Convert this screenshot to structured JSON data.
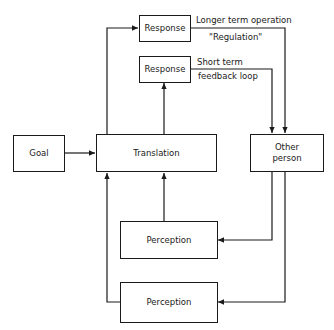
{
  "diagram": {
    "boxes": {
      "goal": "Goal",
      "translation": "Translation",
      "other_person_line1": "Other",
      "other_person_line2": "person",
      "response_top": "Response",
      "response_mid": "Response",
      "perception_top": "Perception",
      "perception_bottom": "Perception"
    },
    "labels": {
      "longer_term": "Longer term operation",
      "regulation": "\"Regulation\"",
      "short_term": "Short term",
      "feedback_loop": "feedback loop"
    },
    "edges": [
      {
        "from": "Goal",
        "to": "Translation"
      },
      {
        "from": "Translation",
        "to": "Response (top)"
      },
      {
        "from": "Translation",
        "to": "Response (mid)"
      },
      {
        "from": "Response (top)",
        "to": "Other person",
        "label": "Longer term operation \"Regulation\""
      },
      {
        "from": "Response (mid)",
        "to": "Other person",
        "label": "Short term feedback loop"
      },
      {
        "from": "Other person",
        "to": "Perception (top)"
      },
      {
        "from": "Other person",
        "to": "Perception (bottom)"
      },
      {
        "from": "Perception (top)",
        "to": "Translation"
      },
      {
        "from": "Perception (bottom)",
        "to": "Translation"
      }
    ]
  }
}
